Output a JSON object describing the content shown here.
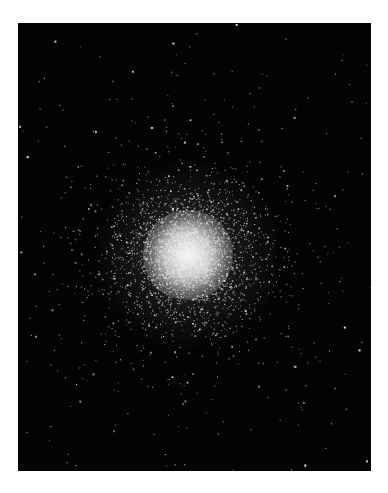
{
  "image": {
    "subject": "globular star cluster on black sky",
    "background_color": "#ffffff",
    "frame": {
      "x": 18,
      "y": 23,
      "width": 353,
      "height": 448,
      "color": "#030303"
    },
    "cluster": {
      "center_x": 170,
      "center_y": 232,
      "core_radius": 28,
      "halo_radius": 95,
      "core_color": "#f2f2f2",
      "halo_color": "#bdbdbd",
      "star_count_cluster": 4200,
      "star_count_field": 170,
      "seed": 7
    }
  }
}
